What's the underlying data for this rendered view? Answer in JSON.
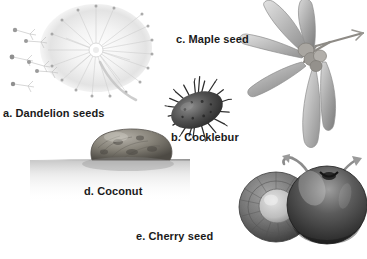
{
  "figure": {
    "background_color": "#ffffff",
    "labels": {
      "dandelion": "a. Dandelion seeds",
      "cocklebur": "b. Cocklebur",
      "maple": "c. Maple seed",
      "coconut": "d. Coconut",
      "cherry": "e. Cherry seed"
    },
    "label_color": "#1a1a1a",
    "illustrations": [
      {
        "key": "a",
        "name": "dandelion-seed-head",
        "description": "Pale gray dandelion seed head with radiating pappus filaments and several detached parachute seeds drifting to the left",
        "tone": "very light gray",
        "fill": "#d8d8d8"
      },
      {
        "key": "b",
        "name": "cocklebur",
        "description": "Dark oval burr covered in hooked spines, tilted diagonally",
        "tone": "dark gray",
        "fill": "#4a4a4a"
      },
      {
        "key": "c",
        "name": "maple-samaras",
        "description": "Cluster of winged maple samaras radiating from a central twig node",
        "tone": "medium gray",
        "fill": "#b0b0b0"
      },
      {
        "key": "d",
        "name": "coconut",
        "description": "Rounded coconut husk floating on a waterline with soft reflection spreading left",
        "tone": "mottled gray-brown",
        "fill": "#8d8a85"
      },
      {
        "key": "e",
        "name": "cherries",
        "description": "Two cherries, the left one halved exposing a round pit, the right whole with a curved stem",
        "tone": "dark gray with highlights",
        "fill": "#6a6a6a"
      }
    ]
  }
}
